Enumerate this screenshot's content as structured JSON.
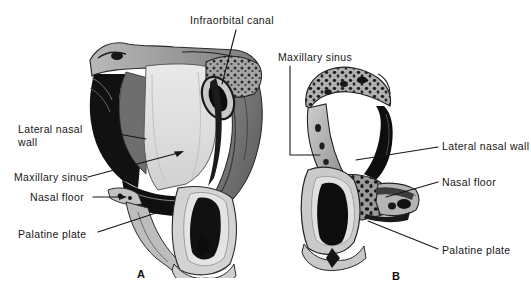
{
  "figure": {
    "background_color": "#ffffff",
    "ink_color": "#161616",
    "width": 531,
    "height": 295
  },
  "panels": [
    {
      "id": "A",
      "caption": "A",
      "caption_x": 137,
      "caption_y": 268
    },
    {
      "id": "B",
      "caption": "B",
      "caption_x": 392,
      "caption_y": 270
    }
  ],
  "labels": [
    {
      "key": "infraorbital_canal",
      "text": "Infraorbital canal",
      "panel": "A",
      "x": 190,
      "y": 15,
      "align": "left",
      "leader": [
        [
          236,
          30
        ],
        [
          222,
          84
        ]
      ]
    },
    {
      "key": "lateral_nasal_wall_a",
      "text": "Lateral nasal wall",
      "panel": "A",
      "x": 18,
      "y": 124,
      "align": "left",
      "two_line": true,
      "leader": [
        [
          96,
          130
        ],
        [
          143,
          140
        ]
      ]
    },
    {
      "key": "maxillary_sinus_a",
      "text": "Maxillary sinus",
      "panel": "A",
      "x": 14,
      "y": 172,
      "align": "left",
      "leader": [
        [
          88,
          177
        ],
        [
          183,
          152
        ]
      ],
      "arrow": true
    },
    {
      "key": "nasal_floor_a",
      "text": "Nasal floor",
      "panel": "A",
      "x": 30,
      "y": 192,
      "align": "left",
      "leader": [
        [
          93,
          197
        ],
        [
          126,
          197
        ]
      ],
      "arrow": true
    },
    {
      "key": "palatine_plate_a",
      "text": "Palatine plate",
      "panel": "A",
      "x": 18,
      "y": 229,
      "align": "left",
      "leader": [
        [
          98,
          232
        ],
        [
          160,
          212
        ]
      ]
    },
    {
      "key": "maxillary_sinus_b",
      "text": "Maxillary sinus",
      "panel": "B",
      "x": 278,
      "y": 51,
      "align": "left",
      "leader": [
        [
          290,
          66
        ],
        [
          290,
          155
        ],
        [
          318,
          155
        ]
      ]
    },
    {
      "key": "lateral_nasal_wall_b",
      "text": "Lateral nasal wall",
      "panel": "B",
      "x": 442,
      "y": 141,
      "align": "left",
      "truncated": true,
      "leader": [
        [
          438,
          147
        ],
        [
          356,
          160
        ]
      ]
    },
    {
      "key": "nasal_floor_b",
      "text": "Nasal floor",
      "panel": "B",
      "x": 442,
      "y": 177,
      "align": "left",
      "leader": [
        [
          438,
          182
        ],
        [
          388,
          196
        ]
      ]
    },
    {
      "key": "palatine_plate_b",
      "text": "Palatine plate",
      "panel": "B",
      "x": 442,
      "y": 245,
      "align": "left",
      "leader": [
        [
          438,
          249
        ],
        [
          370,
          222
        ]
      ]
    }
  ]
}
